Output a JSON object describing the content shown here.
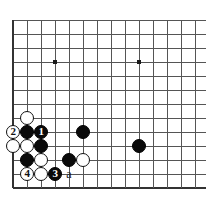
{
  "diagram": {
    "kind": "go-board-diagram",
    "board": {
      "origin_x": 13,
      "origin_y": 20,
      "spacing": 14,
      "cols": 14,
      "rows": 13,
      "line_color": "#555555",
      "edge_color": "#333333",
      "background_color": "#ffffff",
      "stone_radius": 7.2
    },
    "star_points": [
      {
        "name": "star-point-left",
        "col": 3,
        "row": 3
      },
      {
        "name": "star-point-right",
        "col": 9,
        "row": 3
      }
    ],
    "stones": [
      {
        "id": "white-stone-top",
        "color": "white",
        "col": 1,
        "row": 7,
        "label": ""
      },
      {
        "id": "move-2",
        "color": "white",
        "col": 0,
        "row": 8,
        "label": "2"
      },
      {
        "id": "black-stone-b1",
        "color": "black",
        "col": 1,
        "row": 8,
        "label": ""
      },
      {
        "id": "move-1",
        "color": "black",
        "col": 2,
        "row": 8,
        "label": "1"
      },
      {
        "id": "black-stone-b2",
        "color": "black",
        "col": 5,
        "row": 8,
        "label": ""
      },
      {
        "id": "white-stone-w1",
        "color": "white",
        "col": 0,
        "row": 9,
        "label": ""
      },
      {
        "id": "white-stone-w2",
        "color": "white",
        "col": 1,
        "row": 9,
        "label": ""
      },
      {
        "id": "black-stone-b3",
        "color": "black",
        "col": 2,
        "row": 9,
        "label": ""
      },
      {
        "id": "black-stone-right",
        "color": "black",
        "col": 9,
        "row": 9,
        "label": ""
      },
      {
        "id": "black-stone-b4",
        "color": "black",
        "col": 1,
        "row": 10,
        "label": ""
      },
      {
        "id": "white-stone-w3",
        "color": "white",
        "col": 2,
        "row": 10,
        "label": ""
      },
      {
        "id": "black-stone-b5",
        "color": "black",
        "col": 4,
        "row": 10,
        "label": ""
      },
      {
        "id": "white-stone-w4",
        "color": "white",
        "col": 5,
        "row": 10,
        "label": ""
      },
      {
        "id": "move-4",
        "color": "white",
        "col": 1,
        "row": 11,
        "label": "4"
      },
      {
        "id": "white-stone-w5",
        "color": "white",
        "col": 2,
        "row": 11,
        "label": ""
      },
      {
        "id": "move-3",
        "color": "black",
        "col": 3,
        "row": 11,
        "label": "3"
      }
    ],
    "point_labels": [
      {
        "id": "label-a",
        "text": "a",
        "col": 4,
        "row": 11
      }
    ],
    "move_numbers": [
      "1",
      "2",
      "3",
      "4"
    ]
  }
}
